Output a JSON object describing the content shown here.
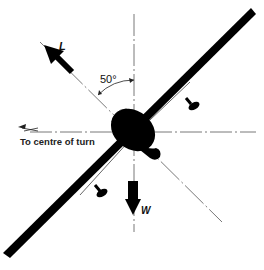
{
  "diagram": {
    "bank_angle_label": "50°",
    "lift_label": "L",
    "weight_label": "W",
    "turn_direction_label": "To centre of turn",
    "colors": {
      "ink": "#000000",
      "background": "#ffffff",
      "guide_line": "#555555"
    }
  }
}
